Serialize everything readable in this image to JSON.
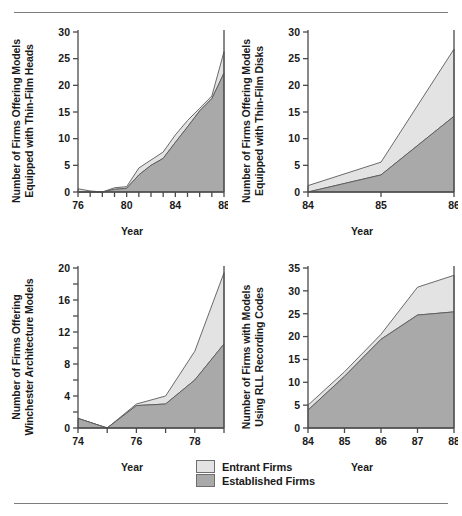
{
  "figure": {
    "rule_top": "horizontal-rule",
    "rule_bottom": "horizontal-rule"
  },
  "colors": {
    "entrant": "#e3e3e3",
    "established": "#a9a9a9",
    "outline": "#5a5a5a",
    "axis": "#4a4a4a",
    "rule": "#7d7d7d"
  },
  "legend": {
    "position": "bottom-center",
    "items": [
      {
        "label": "Entrant Firms",
        "color": "#e3e3e3"
      },
      {
        "label": "Established Firms",
        "color": "#a9a9a9"
      }
    ]
  },
  "chart_data": [
    {
      "type": "area",
      "id": "thin-film-heads",
      "title": "",
      "ylabel": "Number of Firms Offering Models\nEquipped with Thin-Film Heads",
      "xlabel": "Year",
      "grid": false,
      "stacked": true,
      "x": [
        76,
        77,
        78,
        79,
        80,
        81,
        82,
        83,
        84,
        85,
        86,
        87,
        88
      ],
      "xlim": [
        76,
        88
      ],
      "ylim": [
        0,
        30
      ],
      "yticks": [
        0,
        5,
        10,
        15,
        20,
        25,
        30
      ],
      "ytick_labels": [
        "0",
        "5",
        "10",
        "15",
        "20",
        "25",
        "30"
      ],
      "xticks": [
        76,
        77,
        78,
        79,
        80,
        81,
        82,
        83,
        84,
        85,
        86,
        87,
        88
      ],
      "xtick_labels": [
        "76",
        "",
        "",
        "",
        "80",
        "",
        "",
        "",
        "84",
        "",
        "",
        "",
        "88"
      ],
      "series": [
        {
          "name": "Established Firms",
          "color": "#a9a9a9",
          "values": [
            0.0,
            0.0,
            0.0,
            0.5,
            0.7,
            3.2,
            5.0,
            6.3,
            9.3,
            12.2,
            15.2,
            17.5,
            22.3
          ]
        },
        {
          "name": "Entrant Firms",
          "color": "#e3e3e3",
          "values": [
            0.6,
            0.2,
            0.0,
            0.3,
            0.3,
            1.3,
            1.0,
            1.2,
            1.4,
            1.2,
            0.5,
            0.5,
            4.0
          ]
        }
      ],
      "totals": [
        0.6,
        0.2,
        0.0,
        0.8,
        1.0,
        4.5,
        6.0,
        7.5,
        10.7,
        13.4,
        15.7,
        18.0,
        26.3
      ]
    },
    {
      "type": "area",
      "id": "thin-film-disks",
      "title": "",
      "ylabel": "Number of Firms Offering Models\nEquipped with Thin-Film Disks",
      "xlabel": "Year",
      "grid": false,
      "stacked": true,
      "x": [
        84,
        85,
        86
      ],
      "xlim": [
        84,
        86
      ],
      "ylim": [
        0,
        30
      ],
      "yticks": [
        0,
        5,
        10,
        15,
        20,
        25,
        30
      ],
      "ytick_labels": [
        "0",
        "5",
        "10",
        "15",
        "20",
        "25",
        "30"
      ],
      "xticks": [
        84,
        85,
        86
      ],
      "xtick_labels": [
        "84",
        "85",
        "86"
      ],
      "series": [
        {
          "name": "Established Firms",
          "color": "#a9a9a9",
          "values": [
            0.0,
            3.2,
            14.2
          ]
        },
        {
          "name": "Entrant Firms",
          "color": "#e3e3e3",
          "values": [
            1.2,
            2.4,
            12.6
          ]
        }
      ],
      "totals": [
        1.2,
        5.6,
        26.8
      ]
    },
    {
      "type": "area",
      "id": "winchester-architecture",
      "title": "",
      "ylabel": "Number of Firms Offering\nWinchester Architecture Models",
      "xlabel": "Year",
      "grid": false,
      "stacked": true,
      "x": [
        74,
        75,
        76,
        77,
        78,
        79
      ],
      "xlim": [
        74,
        79
      ],
      "ylim": [
        0,
        20
      ],
      "yticks": [
        0,
        2,
        4,
        6,
        8,
        10,
        12,
        14,
        16,
        18,
        20
      ],
      "ytick_labels": [
        "0",
        "",
        "4",
        "",
        "8",
        "",
        "12",
        "",
        "16",
        "",
        "20"
      ],
      "xticks": [
        74,
        75,
        76,
        77,
        78,
        79
      ],
      "xtick_labels": [
        "74",
        "",
        "76",
        "",
        "78",
        ""
      ],
      "series": [
        {
          "name": "Established Firms",
          "color": "#a9a9a9",
          "values": [
            1.2,
            0.0,
            2.8,
            3.0,
            6.0,
            10.5
          ]
        },
        {
          "name": "Entrant Firms",
          "color": "#e3e3e3",
          "values": [
            0.0,
            0.0,
            0.2,
            1.0,
            3.6,
            8.9
          ]
        }
      ],
      "totals": [
        1.2,
        0.0,
        3.0,
        4.0,
        9.6,
        19.4
      ]
    },
    {
      "type": "area",
      "id": "rll-recording-codes",
      "title": "",
      "ylabel": "Number of Firms with Models\nUsing RLL Recording Codes",
      "xlabel": "Year",
      "grid": false,
      "stacked": true,
      "x": [
        84,
        85,
        86,
        87,
        88
      ],
      "xlim": [
        84,
        88
      ],
      "ylim": [
        0,
        35
      ],
      "yticks": [
        0,
        5,
        10,
        15,
        20,
        25,
        30,
        35
      ],
      "ytick_labels": [
        "0",
        "5",
        "10",
        "15",
        "20",
        "25",
        "30",
        "35"
      ],
      "xticks": [
        84,
        85,
        86,
        87,
        88
      ],
      "xtick_labels": [
        "84",
        "85",
        "86",
        "87",
        "88"
      ],
      "series": [
        {
          "name": "Established Firms",
          "color": "#a9a9a9",
          "values": [
            3.9,
            11.3,
            19.4,
            24.7,
            25.4
          ]
        },
        {
          "name": "Entrant Firms",
          "color": "#e3e3e3",
          "values": [
            1.1,
            1.0,
            1.1,
            6.1,
            8.0
          ]
        }
      ],
      "totals": [
        5.0,
        12.3,
        20.5,
        30.8,
        33.4
      ]
    }
  ]
}
